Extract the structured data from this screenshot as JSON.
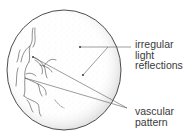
{
  "diagram": {
    "labels": {
      "reflections": {
        "lines": [
          "irregular",
          "light",
          "reflections"
        ]
      },
      "vascular": {
        "lines": [
          "vascular",
          "pattern"
        ]
      }
    },
    "colors": {
      "outline": "#3a3a3a",
      "stipple": "#9a9a9a",
      "vessels": "#444444",
      "text": "#3a3a3a",
      "background": "#ffffff"
    }
  }
}
